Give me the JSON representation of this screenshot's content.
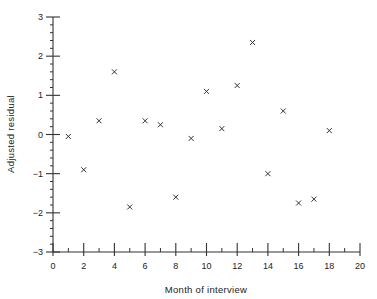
{
  "chart_data": {
    "type": "scatter",
    "title": "",
    "xlabel": "Month of interview",
    "ylabel": "Adjusted residual",
    "xlim": [
      0,
      20
    ],
    "ylim": [
      -3,
      3
    ],
    "x_ticks": [
      0,
      2,
      4,
      6,
      8,
      10,
      12,
      14,
      16,
      18,
      20
    ],
    "x_minor_step": 1,
    "y_ticks": [
      -3,
      -2,
      -1,
      0,
      1,
      2,
      3
    ],
    "y_minor_step": 0.2,
    "grid": false,
    "legend": null,
    "marker": "x",
    "series": [
      {
        "name": "Adjusted residual",
        "x": [
          1,
          2,
          3,
          4,
          5,
          6,
          7,
          8,
          9,
          10,
          11,
          12,
          13,
          14,
          15,
          16,
          17,
          18
        ],
        "y": [
          -0.05,
          -0.9,
          0.35,
          1.6,
          -1.85,
          0.35,
          0.25,
          -1.6,
          -0.1,
          1.1,
          0.15,
          1.25,
          2.35,
          -1.0,
          0.6,
          -1.75,
          -1.65,
          0.1
        ]
      }
    ]
  }
}
